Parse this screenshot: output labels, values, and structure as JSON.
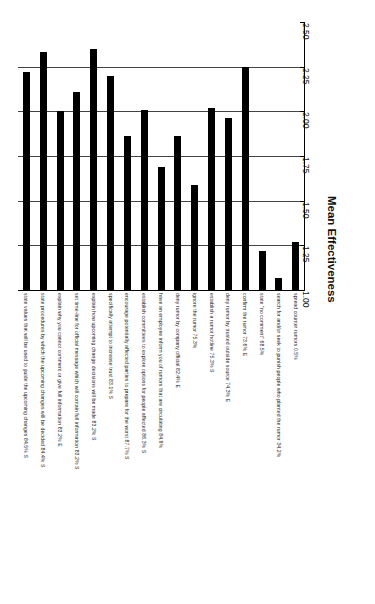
{
  "chart_data": {
    "type": "bar",
    "title": "",
    "subtitle": "",
    "orientation": "vertical-bars-rotated-labels",
    "xlabel": "",
    "ylabel": "Mean Effectiveness",
    "ylim": [
      1.0,
      2.5
    ],
    "ytick_step": 0.25,
    "grid": true,
    "gridlines_at": [
      1.25,
      1.5,
      1.75,
      2.0,
      2.25
    ],
    "legend": null,
    "bar_color": "#000000",
    "background_color": "#ffffff",
    "axis_color": "#000000",
    "tick_labels": [
      "1.00",
      "1.25",
      "1.50",
      "1.75",
      "2.00",
      "2.25",
      "2.50"
    ],
    "tick_values": [
      1.0,
      1.25,
      1.5,
      1.75,
      2.0,
      2.25,
      2.5
    ],
    "categories": [
      "state values that will be used to guide the upcoming changes  84.5% S",
      "state procedures by which the upcoming changes will be decided  84.4% S",
      "explain why you cannot comment or give full information  83.2% E",
      "set time-line for official message which will contain full information  83.2% S",
      "explain how upcoming change decisions will be made  83.2% S",
      "specifically attempt to increase trust  83.1% S",
      "encourage potentially affected parties to prepare for the worst  87.7% S",
      "establish committees to explore options for people affected  86.3% S",
      "have an employee inform you of rumors that are circulating  84.9%",
      "deny rumor by company official  82.4% E",
      "ignore the rumor  75.3%",
      "establish a rumor hotline  75.3% S",
      "deny rumor by trusted outside source  74.3% E",
      "confirm the rumor  73.6% E",
      "state \"no comment\"  68.5%",
      "search for and/or seek to punish people who planted the rumor  34.2%",
      "spread counter rumors  0.5%"
    ],
    "values": [
      2.22,
      2.33,
      2.0,
      2.11,
      2.35,
      2.2,
      1.86,
      2.01,
      1.69,
      1.86,
      1.59,
      2.02,
      1.96,
      2.25,
      1.22,
      1.07,
      1.27
    ]
  },
  "figure": {
    "axis_title": "Mean Effectiveness"
  }
}
